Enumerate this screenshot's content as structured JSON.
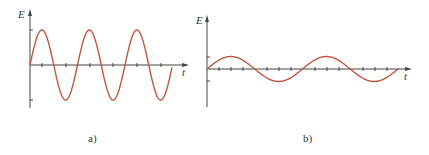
{
  "panels": [
    {
      "id": "a",
      "caption": "a)",
      "y_label": "E",
      "x_label": "t",
      "description": "Sinusoidal E vs t, large amplitude, short period (3 cycles)",
      "curve_color": "#c0573f"
    },
    {
      "id": "b",
      "caption": "b)",
      "y_label": "E",
      "x_label": "t",
      "description": "Sinusoidal E vs t, small amplitude, long period (2 cycles)",
      "curve_color": "#c0573f"
    }
  ],
  "colors": {
    "axis": "#444444",
    "curve": "#c0573f"
  }
}
